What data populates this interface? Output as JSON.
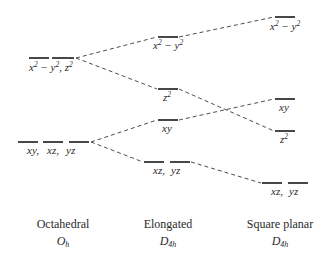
{
  "diagram": {
    "type": "d-orbital splitting diagram",
    "columns": [
      {
        "geometry": "Octahedral",
        "point_group": "O",
        "point_group_sub": "h",
        "levels": [
          {
            "id": "oh_eg",
            "label_parts": [
              "x",
              "2",
              " − y",
              "2",
              ", z",
              "2"
            ],
            "label": "x2 − y2, z2",
            "y": 58,
            "segments": [
              [
                29,
                49
              ],
              [
                52,
                74
              ]
            ]
          },
          {
            "id": "oh_t2g",
            "label": "xy, xz, yz",
            "y": 142,
            "segments": [
              [
                18,
                38
              ],
              [
                43,
                63
              ],
              [
                69,
                89
              ]
            ]
          }
        ]
      },
      {
        "geometry": "Elongated",
        "point_group": "D",
        "point_group_sub": "4h",
        "levels": [
          {
            "id": "el_x2y2",
            "label": "x2 − y2",
            "y": 37,
            "segments": [
              [
                158,
                178
              ]
            ]
          },
          {
            "id": "el_z2",
            "label": "z2",
            "y": 89,
            "segments": [
              [
                158,
                178
              ]
            ]
          },
          {
            "id": "el_xy",
            "label": "xy",
            "y": 120,
            "segments": [
              [
                158,
                178
              ]
            ]
          },
          {
            "id": "el_xzyz",
            "label": "xz, yz",
            "y": 162,
            "segments": [
              [
                144,
                164
              ],
              [
                170,
                190
              ]
            ]
          }
        ]
      },
      {
        "geometry": "Square planar",
        "point_group": "D",
        "point_group_sub": "4h",
        "levels": [
          {
            "id": "sp_x2y2",
            "label": "x2 − y2",
            "y": 17,
            "segments": [
              [
                275,
                295
              ]
            ]
          },
          {
            "id": "sp_xy",
            "label": "xy",
            "y": 99,
            "segments": [
              [
                275,
                295
              ]
            ]
          },
          {
            "id": "sp_z2",
            "label": "z2",
            "y": 131,
            "segments": [
              [
                275,
                295
              ]
            ]
          },
          {
            "id": "sp_xzyz",
            "label": "xz, yz",
            "y": 183,
            "segments": [
              [
                262,
                282
              ],
              [
                288,
                308
              ]
            ]
          }
        ]
      }
    ],
    "connections": [
      {
        "from": "oh_eg",
        "to": "el_x2y2"
      },
      {
        "from": "oh_eg",
        "to": "el_z2"
      },
      {
        "from": "oh_t2g",
        "to": "el_xy"
      },
      {
        "from": "oh_t2g",
        "to": "el_xzyz"
      },
      {
        "from": "el_x2y2",
        "to": "sp_x2y2"
      },
      {
        "from": "el_z2",
        "to": "sp_z2"
      },
      {
        "from": "el_xy",
        "to": "sp_xy"
      },
      {
        "from": "el_xzyz",
        "to": "sp_xzyz"
      }
    ],
    "text": {
      "x": "x",
      "y": "y",
      "z": "z",
      "sq": "2",
      "minus": " − ",
      "comma": ", ",
      "xy": "xy",
      "xz": "xz,",
      "yz": "yz",
      "xy_comma": "xy,",
      "xz_comma": "xz,"
    }
  }
}
